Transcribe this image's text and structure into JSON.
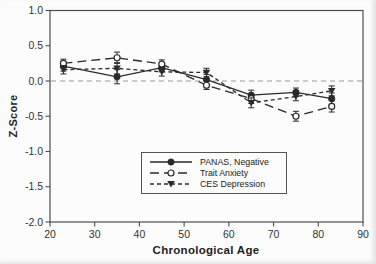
{
  "chart_data": {
    "type": "line",
    "title": "",
    "xlabel": "Chronological Age",
    "ylabel": "Z-Score",
    "xlim": [
      20,
      90
    ],
    "ylim": [
      -2.0,
      1.0
    ],
    "x_ticks": [
      20,
      30,
      40,
      50,
      60,
      70,
      80,
      90
    ],
    "y_ticks": [
      1.0,
      0.5,
      0.0,
      -0.5,
      -1.0,
      -1.5,
      -2.0
    ],
    "y_tick_labels": [
      "1.0",
      "0.5",
      "0.0",
      "-0.5",
      "-1.0",
      "-1.5",
      "-2.0"
    ],
    "grid": false,
    "zero_reference_line": 0.0,
    "legend_position": "inside-bottom-center",
    "x": [
      23,
      35,
      45,
      55,
      65,
      75,
      83
    ],
    "series": [
      {
        "name": "PANAS, Negative",
        "marker": "filled-circle",
        "line": "solid",
        "values": [
          0.21,
          0.06,
          0.19,
          0.02,
          -0.2,
          -0.16,
          -0.25
        ],
        "errors": [
          0.07,
          0.1,
          0.06,
          0.07,
          0.07,
          0.06,
          0.08
        ]
      },
      {
        "name": "Trait Anxiety",
        "marker": "open-circle",
        "line": "long-dash",
        "values": [
          0.25,
          0.33,
          0.24,
          -0.06,
          -0.25,
          -0.5,
          -0.36
        ],
        "errors": [
          0.06,
          0.08,
          0.06,
          0.06,
          0.07,
          0.07,
          0.08
        ]
      },
      {
        "name": "CES Depression",
        "marker": "filled-triangle-down",
        "line": "short-dash",
        "values": [
          0.16,
          0.18,
          0.13,
          0.12,
          -0.31,
          -0.22,
          -0.14
        ],
        "errors": [
          0.06,
          0.08,
          0.06,
          0.06,
          0.07,
          0.06,
          0.07
        ]
      }
    ],
    "colors": {
      "line": "#2a2a2a",
      "frame": "#4d4d4d",
      "tick_text": "#333333",
      "zero_line": "#9a9a9a",
      "background": "#fcfcfc"
    }
  }
}
